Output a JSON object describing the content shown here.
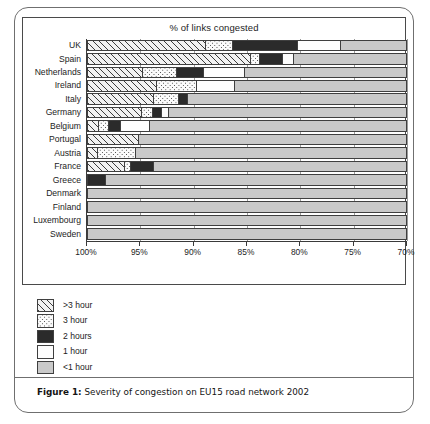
{
  "figure": {
    "caption_label": "Figure 1:",
    "caption_text": " Severity of congestion on EU15 road network 2002"
  },
  "chart_data": {
    "type": "bar",
    "orientation": "horizontal",
    "stacked": true,
    "title": "% of links congested",
    "xlabel": "",
    "ylabel": "",
    "xlim": [
      100,
      70
    ],
    "axis_reversed": true,
    "tick_labels": [
      "100%",
      "95%",
      "90%",
      "85%",
      "80%",
      "75%",
      "70%"
    ],
    "tick_values": [
      100,
      95,
      90,
      85,
      80,
      75,
      70
    ],
    "grid": true,
    "legend_position": "below-left",
    "categories": [
      "UK",
      "Spain",
      "Netherlands",
      "Ireland",
      "Italy",
      "Germany",
      "Belgium",
      "Portugal",
      "Austria",
      "France",
      "Greece",
      "Denmark",
      "Finland",
      "Luxembourg",
      "Sweden"
    ],
    "series": [
      {
        "name": ">3 hour",
        "fill": "diagonal-hatch",
        "color": "#f2f2f2",
        "values": [
          11.1,
          15.3,
          5.2,
          6.5,
          6.2,
          5.1,
          1.0,
          4.8,
          0.9,
          3.5,
          0.0,
          0.0,
          0.0,
          0.0,
          0.0
        ]
      },
      {
        "name": "3 hour",
        "fill": "dotted",
        "color": "#fbfbfb",
        "values": [
          2.5,
          0.8,
          3.1,
          3.7,
          2.3,
          1.0,
          1.0,
          0.0,
          3.6,
          0.5,
          0.0,
          0.0,
          0.0,
          0.0,
          0.0
        ]
      },
      {
        "name": "2 hours",
        "fill": "solid-black",
        "color": "#2b2b2b",
        "values": [
          6.1,
          2.2,
          2.6,
          0.0,
          0.9,
          0.8,
          1.1,
          0.0,
          0.0,
          2.2,
          1.7,
          0.0,
          0.0,
          0.0,
          0.0
        ]
      },
      {
        "name": "1 hour",
        "fill": "solid-white",
        "color": "#fdfdfd",
        "values": [
          4.0,
          1.0,
          3.8,
          3.6,
          0.0,
          0.7,
          2.7,
          0.0,
          0.0,
          0.0,
          0.0,
          0.0,
          0.0,
          0.0,
          0.0
        ]
      },
      {
        "name": "<1 hour",
        "fill": "solid-gray",
        "color": "#c9c9c9",
        "values": [
          6.3,
          10.7,
          15.3,
          16.2,
          20.6,
          22.4,
          24.2,
          25.2,
          25.5,
          23.8,
          28.3,
          30.0,
          30.0,
          30.0,
          30.0
        ]
      }
    ],
    "legend": [
      {
        "label": ">3 hour",
        "fill": "diagonal-hatch"
      },
      {
        "label": "3 hour",
        "fill": "dotted"
      },
      {
        "label": "2 hours",
        "fill": "solid-black"
      },
      {
        "label": "1 hour",
        "fill": "solid-white"
      },
      {
        "label": "<1 hour",
        "fill": "solid-gray"
      }
    ]
  }
}
